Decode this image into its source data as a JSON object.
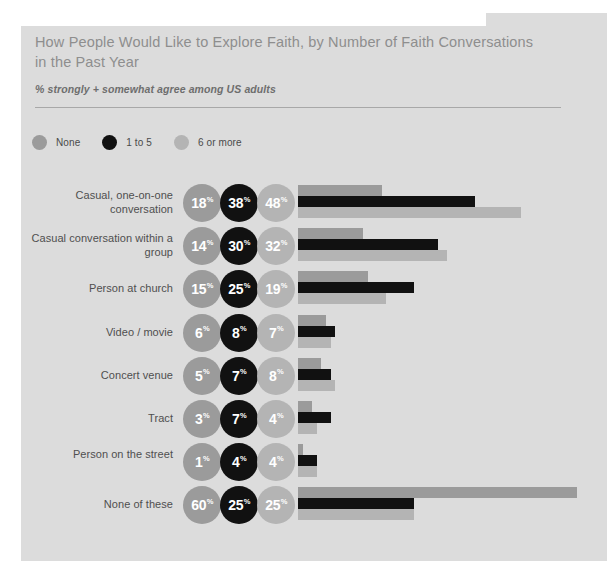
{
  "header": {
    "title": "How People Would Like to Explore Faith, by Number of Faith Conversations in the Past Year",
    "subtitle": "% strongly + somewhat agree among US adults"
  },
  "legend": {
    "items": [
      {
        "label": "None",
        "color": "#9b9b9b",
        "icon": "circle-icon"
      },
      {
        "label": "1 to 5",
        "color": "#111111",
        "icon": "circle-icon"
      },
      {
        "label": "6 or more",
        "color": "#b4b4b4",
        "icon": "circle-icon"
      }
    ]
  },
  "chart_data": {
    "type": "bar",
    "title": "How People Would Like to Explore Faith, by Number of Faith Conversations in the Past Year",
    "subtitle": "% strongly + somewhat agree among US adults",
    "xlabel": "",
    "ylabel": "",
    "xlim": [
      0,
      60
    ],
    "grid": false,
    "legend_position": "top-left",
    "value_suffix": "%",
    "categories": [
      "Casual, one-on-one conversation",
      "Casual conversation within a group",
      "Person at church",
      "Video / movie",
      "Concert venue",
      "Tract",
      "Person on the street",
      "None of these"
    ],
    "series": [
      {
        "name": "None",
        "color": "#9b9b9b",
        "values": [
          18,
          14,
          15,
          6,
          5,
          3,
          1,
          60
        ]
      },
      {
        "name": "1 to 5",
        "color": "#111111",
        "values": [
          38,
          30,
          25,
          8,
          7,
          7,
          4,
          25
        ]
      },
      {
        "name": "6 or more",
        "color": "#b4b4b4",
        "values": [
          48,
          32,
          19,
          7,
          8,
          4,
          4,
          25
        ]
      }
    ]
  }
}
